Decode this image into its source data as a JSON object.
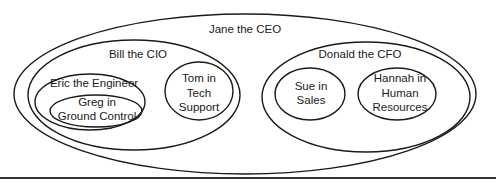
{
  "diagram": {
    "type": "nested-venn / org hierarchy",
    "nodes": {
      "jane": {
        "label": "Jane the CEO"
      },
      "bill": {
        "label": "Bill the CIO"
      },
      "donald": {
        "label": "Donald the CFO"
      },
      "eric": {
        "label": "Eric the Engineer"
      },
      "greg": {
        "lines": [
          "Greg in",
          "Ground Control"
        ]
      },
      "tom": {
        "lines": [
          "Tom in",
          "Tech",
          "Support"
        ]
      },
      "sue": {
        "lines": [
          "Sue in",
          "Sales"
        ]
      },
      "hannah": {
        "lines": [
          "Hannah in",
          "Human",
          "Resources"
        ]
      }
    },
    "hierarchy": {
      "Jane the CEO": {
        "Bill the CIO": {
          "Eric the Engineer": [
            "Greg in Ground Control"
          ],
          "Tom in Tech Support": []
        },
        "Donald the CFO": {
          "Sue in Sales": [],
          "Hannah in Human Resources": []
        }
      }
    },
    "colors": {
      "stroke": "#1a1a1a",
      "background": "#ffffff"
    }
  }
}
